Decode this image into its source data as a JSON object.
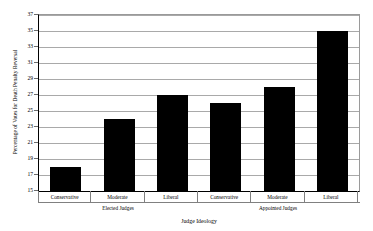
{
  "chart_data": {
    "type": "bar",
    "title": "",
    "xlabel": "Judge Ideology",
    "ylabel": "Percentage of Votes for Death Penalty Reversal",
    "ylim": [
      15,
      37
    ],
    "ytick_step": 2,
    "yticks": [
      37,
      35,
      33,
      31,
      29,
      27,
      25,
      23,
      21,
      19,
      17,
      15
    ],
    "grid": true,
    "legend": "none",
    "categories": [
      "Conservative",
      "Moderate",
      "Liberal",
      "Conservative",
      "Moderate",
      "Liberal"
    ],
    "values": [
      18,
      24,
      27,
      26,
      28,
      35
    ],
    "groups": [
      {
        "label": "Elected Judges",
        "span": 3
      },
      {
        "label": "Appointed Judges",
        "span": 3
      }
    ],
    "series": [
      {
        "name": "Percentage of Votes for Death Penalty Reversal",
        "color": "#000000",
        "values": [
          18,
          24,
          27,
          26,
          28,
          35
        ]
      }
    ],
    "bars": [
      {
        "category": "Conservative",
        "group": "Elected Judges",
        "value": 18
      },
      {
        "category": "Moderate",
        "group": "Elected Judges",
        "value": 24
      },
      {
        "category": "Liberal",
        "group": "Elected Judges",
        "value": 27
      },
      {
        "category": "Conservative",
        "group": "Appointed Judges",
        "value": 26
      },
      {
        "category": "Moderate",
        "group": "Appointed Judges",
        "value": 28
      },
      {
        "category": "Liberal",
        "group": "Appointed Judges",
        "value": 35
      }
    ],
    "colors": {
      "bar_fill": "#000000",
      "gridline": "#a9a9a9",
      "axis": "#000000",
      "plot_background": "#ffffff"
    }
  }
}
